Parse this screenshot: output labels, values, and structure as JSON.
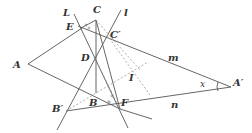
{
  "diagram": {
    "type": "geometry-construction",
    "stroke_color": "#555555",
    "dashed_color": "#999999",
    "label_color": "#333333",
    "points": [
      {
        "name": "A",
        "label": "A",
        "x": 28,
        "y": 64,
        "lx": 13,
        "ly": 68
      },
      {
        "name": "A-prime",
        "label": "A′",
        "x": 231,
        "y": 87,
        "lx": 233,
        "ly": 86
      },
      {
        "name": "C",
        "label": "C",
        "x": 96,
        "y": 20,
        "lx": 93,
        "ly": 13
      },
      {
        "name": "C-prime",
        "label": "C′",
        "x": 107,
        "y": 35,
        "lx": 110,
        "ly": 38
      },
      {
        "name": "E",
        "label": "E",
        "x": 81,
        "y": 28,
        "lx": 66,
        "ly": 30
      },
      {
        "name": "D",
        "label": "D",
        "x": 95,
        "y": 58,
        "lx": 81,
        "ly": 61
      },
      {
        "name": "B",
        "label": "B",
        "x": 96,
        "y": 93,
        "lx": 89,
        "ly": 106
      },
      {
        "name": "F",
        "label": "F",
        "x": 120,
        "y": 109,
        "lx": 121,
        "ly": 106
      },
      {
        "name": "B-prime",
        "label": "B′",
        "x": 66,
        "y": 111,
        "lx": 52,
        "ly": 112
      },
      {
        "name": "I",
        "label": "I",
        "x": 130,
        "y": 78,
        "lx": 129,
        "ly": 81
      }
    ],
    "line_labels": [
      {
        "name": "L",
        "label": "L",
        "lx": 63,
        "ly": 16
      },
      {
        "name": "l",
        "label": "l",
        "lx": 124,
        "ly": 16
      },
      {
        "name": "m",
        "label": "m",
        "lx": 168,
        "ly": 61
      },
      {
        "name": "n",
        "label": "n",
        "lx": 171,
        "ly": 108
      }
    ],
    "angle_label": {
      "label": "x",
      "lx": 200,
      "ly": 87
    }
  }
}
